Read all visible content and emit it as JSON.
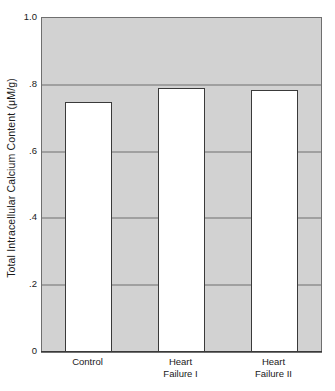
{
  "chart_data": {
    "type": "bar",
    "title": "",
    "subtitle": "",
    "xlabel": "",
    "ylabel": "Total Intracellular Calcium Content (μM/g)",
    "categories": [
      "Control",
      "Heart Failure I",
      "Heart Failure II"
    ],
    "category_lines": [
      [
        "Control"
      ],
      [
        "Heart",
        "Failure I"
      ],
      [
        "Heart",
        "Failure II"
      ]
    ],
    "values": [
      0.75,
      0.79,
      0.785
    ],
    "ylim": [
      0,
      1.0
    ],
    "ytick_values": [
      0,
      0.2,
      0.4,
      0.6,
      0.8,
      1.0
    ],
    "ytick_labels": [
      "0",
      ".2",
      ".4",
      ".6",
      ".8",
      "1.0"
    ],
    "grid": true,
    "gridlines_at": [
      0.2,
      0.4,
      0.6,
      0.8
    ],
    "legend": null,
    "legend_position": "none",
    "annotations": [],
    "colors": {
      "plot_background": "#d2d2d2",
      "bar_fill": "#ffffff",
      "bar_edge": "#3a3a3a",
      "gridline": "#6f6f6f",
      "axis": "#3a3a3a",
      "text": "#1a1a1a",
      "figure_background": "#ffffff"
    }
  }
}
